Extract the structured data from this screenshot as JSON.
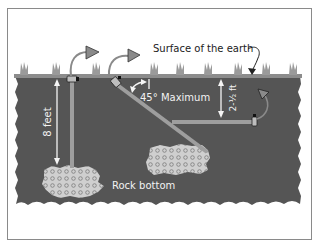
{
  "diagram": {
    "labels": {
      "surface": "Surface of the earth",
      "depth_vertical": "8 feet",
      "angle": "45° Maximum",
      "depth_horizontal": "2-½ ft",
      "rock": "Rock bottom"
    },
    "colors": {
      "frame": "#8a8a8a",
      "soil": "#555555",
      "surface_band": "#8c8c8c",
      "grass": "#9a9a9a",
      "rod": "#9e9e9e",
      "rock_fill": "#c8c8c8",
      "arrow_fill": "#8a8a8a",
      "text_dark": "#222222",
      "text_light": "#f2f2f2"
    },
    "rods": [
      {
        "name": "vertical-rod",
        "orientation": "vertical"
      },
      {
        "name": "angled-rod",
        "orientation": "45 degrees"
      },
      {
        "name": "horizontal-rod",
        "orientation": "horizontal trench"
      }
    ]
  }
}
